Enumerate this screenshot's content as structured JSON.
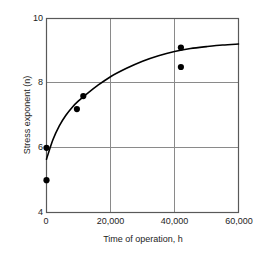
{
  "chart_data": {
    "type": "scatter",
    "title": "",
    "subtitle": "",
    "xlabel": "Time of operation, h",
    "ylabel": "Stress exponent (n)",
    "xlim": [
      0,
      60000
    ],
    "ylim": [
      4,
      10
    ],
    "grid": true,
    "legend": null,
    "xticks": [
      0,
      20000,
      40000,
      60000
    ],
    "xtick_labels": [
      "0",
      "20,000",
      "40,000",
      "60,000"
    ],
    "yticks": [
      4,
      6,
      8,
      10
    ],
    "ytick_labels": [
      "4",
      "6",
      "8",
      "10"
    ],
    "series": [
      {
        "name": "Measured data",
        "marker": "filled-circle",
        "color": "#000000",
        "points": [
          {
            "x": 0,
            "y": 5.0
          },
          {
            "x": 0,
            "y": 6.0
          },
          {
            "x": 9500,
            "y": 7.2
          },
          {
            "x": 11500,
            "y": 7.6
          },
          {
            "x": 42000,
            "y": 9.1
          },
          {
            "x": 42000,
            "y": 8.5
          }
        ]
      },
      {
        "name": "Fitted curve",
        "marker": "none",
        "style": "solid-line",
        "color": "#000000",
        "points": [
          {
            "x": 0,
            "y": 5.65
          },
          {
            "x": 2000,
            "y": 6.25
          },
          {
            "x": 4000,
            "y": 6.68
          },
          {
            "x": 6000,
            "y": 7.0
          },
          {
            "x": 8000,
            "y": 7.25
          },
          {
            "x": 10000,
            "y": 7.45
          },
          {
            "x": 13000,
            "y": 7.7
          },
          {
            "x": 16000,
            "y": 7.93
          },
          {
            "x": 20000,
            "y": 8.2
          },
          {
            "x": 25000,
            "y": 8.46
          },
          {
            "x": 30000,
            "y": 8.68
          },
          {
            "x": 35000,
            "y": 8.85
          },
          {
            "x": 40000,
            "y": 8.98
          },
          {
            "x": 45000,
            "y": 9.07
          },
          {
            "x": 50000,
            "y": 9.13
          },
          {
            "x": 55000,
            "y": 9.18
          },
          {
            "x": 60000,
            "y": 9.21
          }
        ]
      }
    ]
  },
  "axes": {
    "x_title": "Time of operation, h",
    "y_title": "Stress exponent (n)",
    "x_tick_0": "0",
    "x_tick_1": "20,000",
    "x_tick_2": "40,000",
    "x_tick_3": "60,000",
    "y_tick_0": "4",
    "y_tick_1": "6",
    "y_tick_2": "8",
    "y_tick_3": "10"
  },
  "colors": {
    "frame": "#6d6d6d",
    "grid": "#8a8a8a",
    "curve": "#000000",
    "marker": "#000000",
    "text": "#1d1d1d",
    "background": "#ffffff"
  }
}
